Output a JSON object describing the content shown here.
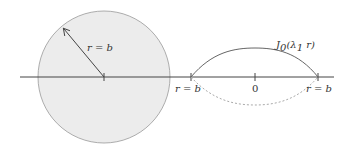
{
  "diagram": {
    "left_panel": {
      "shape": "disk",
      "fill_color": "#ececec",
      "stroke_color": "#999999",
      "radius_label": "r = b"
    },
    "right_panel": {
      "curve_label_main": "J",
      "curve_label_sub": "0",
      "curve_label_arg_open": "(λ",
      "curve_label_arg_sub": "1",
      "curve_label_arg_close": " r)",
      "left_endpoint_label": "r = b",
      "center_label": "0",
      "right_endpoint_label": "r = b",
      "solid_curve_color": "#666666",
      "dashed_curve_color": "#aaaaaa"
    },
    "axis_color": "#444444"
  }
}
